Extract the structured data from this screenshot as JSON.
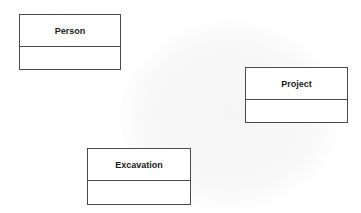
{
  "diagram": {
    "type": "uml-class-diagram",
    "classes": [
      {
        "name": "Person",
        "attributes": []
      },
      {
        "name": "Project",
        "attributes": []
      },
      {
        "name": "Excavation",
        "attributes": []
      }
    ]
  },
  "colors": {
    "border": "#4a4a4a",
    "text": "#1a1a1a",
    "background": "#ffffff"
  }
}
